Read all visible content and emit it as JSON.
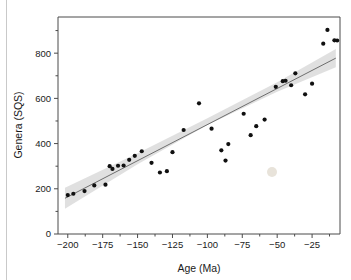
{
  "figure": {
    "background_color": "#ffffff",
    "point_color": "#101010",
    "band_color": "#d5d5d5",
    "line_color": "#6e6e6e",
    "axis_color": "#4a4a4a"
  },
  "chart_data": {
    "type": "scatter",
    "title": "",
    "xlabel": "Age (Ma)",
    "ylabel": "Genera (SQS)",
    "xlim": [
      -207,
      -5
    ],
    "ylim": [
      0,
      960
    ],
    "grid": false,
    "legend": null,
    "xticks": [
      -200,
      -175,
      -150,
      -125,
      -100,
      -75,
      -50,
      -25
    ],
    "xticklabels": [
      "−200",
      "−175",
      "−150",
      "−125",
      "−100",
      "−75",
      "−50",
      "−25"
    ],
    "xminorticks": [
      -187.5,
      -162.5,
      -137.5,
      -112.5,
      -87.5,
      -62.5,
      -37.5,
      -12.5
    ],
    "yticks": [
      0,
      200,
      400,
      600,
      800
    ],
    "yticklabels": [
      "0",
      "200",
      "400",
      "600",
      "800"
    ],
    "yminorticks": [
      100,
      300,
      500,
      700,
      900
    ],
    "points": [
      {
        "x": -200,
        "y": 172
      },
      {
        "x": -196,
        "y": 178
      },
      {
        "x": -188,
        "y": 190
      },
      {
        "x": -181,
        "y": 215
      },
      {
        "x": -173,
        "y": 218
      },
      {
        "x": -170,
        "y": 300
      },
      {
        "x": -168,
        "y": 288
      },
      {
        "x": -164,
        "y": 302
      },
      {
        "x": -160,
        "y": 303
      },
      {
        "x": -156,
        "y": 328
      },
      {
        "x": -152,
        "y": 346
      },
      {
        "x": -147,
        "y": 366
      },
      {
        "x": -140,
        "y": 315
      },
      {
        "x": -134,
        "y": 272
      },
      {
        "x": -129,
        "y": 278
      },
      {
        "x": -125,
        "y": 362
      },
      {
        "x": -117,
        "y": 460
      },
      {
        "x": -106,
        "y": 578
      },
      {
        "x": -97,
        "y": 466
      },
      {
        "x": -90,
        "y": 370
      },
      {
        "x": -87,
        "y": 325
      },
      {
        "x": -85,
        "y": 398
      },
      {
        "x": -74,
        "y": 532
      },
      {
        "x": -69,
        "y": 437
      },
      {
        "x": -65,
        "y": 477
      },
      {
        "x": -59,
        "y": 506
      },
      {
        "x": -51,
        "y": 651
      },
      {
        "x": -46,
        "y": 676
      },
      {
        "x": -44,
        "y": 678
      },
      {
        "x": -40,
        "y": 658
      },
      {
        "x": -37,
        "y": 711
      },
      {
        "x": -30,
        "y": 618
      },
      {
        "x": -25,
        "y": 665
      },
      {
        "x": -17,
        "y": 842
      },
      {
        "x": -14,
        "y": 903
      },
      {
        "x": -9,
        "y": 857
      },
      {
        "x": -7,
        "y": 856
      }
    ],
    "fit_line": {
      "name": "linear regression",
      "x_start": -202,
      "y_start": 158,
      "x_end": -8,
      "y_end": 778
    },
    "confidence_band": {
      "name": "95% confidence interval",
      "upper": [
        {
          "x": -202,
          "y": 205
        },
        {
          "x": -150,
          "y": 357
        },
        {
          "x": -100,
          "y": 512
        },
        {
          "x": -50,
          "y": 671
        },
        {
          "x": -8,
          "y": 818
        }
      ],
      "lower": [
        {
          "x": -202,
          "y": 112
        },
        {
          "x": -150,
          "y": 309
        },
        {
          "x": -100,
          "y": 482
        },
        {
          "x": -50,
          "y": 629
        },
        {
          "x": -8,
          "y": 738
        }
      ]
    }
  }
}
